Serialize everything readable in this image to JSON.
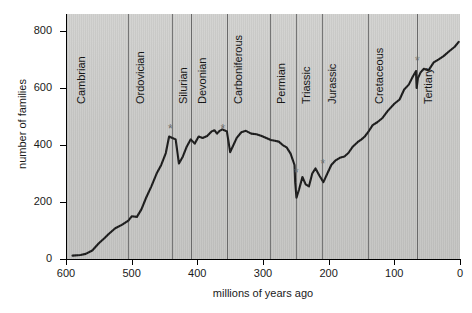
{
  "figure": {
    "background_color": "#c9c9c7",
    "curve_color": "#1a1a1a",
    "divider_color": "#6d6d6d",
    "marker_color": "#6a6a6a"
  },
  "chart_data": {
    "type": "line",
    "title": "",
    "xlabel": "millions of years ago",
    "ylabel": "number of families",
    "xlim": [
      600,
      0
    ],
    "ylim": [
      0,
      860
    ],
    "x_reversed": true,
    "grid": false,
    "legend": "none",
    "xticks": [
      600,
      500,
      400,
      300,
      200,
      100,
      0
    ],
    "yticks": [
      0,
      200,
      400,
      600,
      800
    ],
    "xtick_labels": [
      "600",
      "500",
      "400",
      "300",
      "200",
      "100",
      "0"
    ],
    "ytick_labels": [
      "0",
      "200",
      "400",
      "600",
      "800"
    ],
    "series": [
      {
        "name": "marine animal families",
        "x": [
          590,
          578,
          570,
          560,
          550,
          542,
          535,
          525,
          515,
          505,
          500,
          492,
          485,
          478,
          470,
          462,
          455,
          448,
          443,
          438,
          433,
          428,
          422,
          416,
          410,
          404,
          398,
          392,
          385,
          378,
          374,
          370,
          366,
          362,
          359,
          355,
          350,
          345,
          340,
          333,
          326,
          318,
          310,
          302,
          295,
          288,
          282,
          276,
          270,
          264,
          258,
          252,
          251,
          249,
          245,
          240,
          235,
          230,
          225,
          220,
          214,
          208,
          202,
          199,
          196,
          190,
          183,
          176,
          170,
          163,
          156,
          150,
          145,
          140,
          133,
          126,
          118,
          110,
          100,
          92,
          85,
          78,
          72,
          67,
          66,
          64,
          60,
          55,
          48,
          40,
          33,
          25,
          16,
          8,
          2
        ],
        "y": [
          12,
          14,
          18,
          30,
          55,
          72,
          88,
          108,
          120,
          135,
          150,
          148,
          175,
          215,
          255,
          300,
          330,
          372,
          430,
          425,
          420,
          335,
          360,
          395,
          420,
          405,
          430,
          425,
          432,
          448,
          452,
          440,
          450,
          455,
          452,
          448,
          375,
          400,
          425,
          445,
          450,
          440,
          438,
          432,
          425,
          418,
          415,
          412,
          400,
          392,
          370,
          330,
          268,
          215,
          245,
          288,
          262,
          255,
          300,
          318,
          292,
          270,
          300,
          315,
          330,
          345,
          355,
          360,
          372,
          395,
          410,
          420,
          430,
          445,
          470,
          480,
          495,
          520,
          545,
          560,
          595,
          612,
          640,
          660,
          600,
          635,
          655,
          668,
          662,
          690,
          700,
          712,
          730,
          745,
          762
        ]
      }
    ],
    "extinction_markers": [
      {
        "name": "end-Ordovician",
        "x": 440,
        "y": 452,
        "symbol": "*"
      },
      {
        "name": "late-Devonian",
        "x": 360,
        "y": 452,
        "symbol": "*"
      },
      {
        "name": "end-Permian",
        "x": 248,
        "y": 300,
        "symbol": "*"
      },
      {
        "name": "end-Triassic",
        "x": 208,
        "y": 330,
        "symbol": "*"
      },
      {
        "name": "end-Cretaceous",
        "x": 64,
        "y": 690,
        "symbol": "*"
      }
    ],
    "periods": [
      {
        "label": "Cambrian",
        "boundary_start": 600,
        "boundary_end": 505,
        "label_x": 588
      },
      {
        "label": "Ordovician",
        "boundary_start": 505,
        "boundary_end": 438,
        "label_x": 498
      },
      {
        "label": "Silurian",
        "boundary_start": 438,
        "boundary_end": 410,
        "label_x": 433
      },
      {
        "label": "Devonian",
        "boundary_start": 410,
        "boundary_end": 355,
        "label_x": 404
      },
      {
        "label": "Carboniferous",
        "boundary_start": 355,
        "boundary_end": 290,
        "label_x": 349
      },
      {
        "label": "Permian",
        "boundary_start": 290,
        "boundary_end": 250,
        "label_x": 284
      },
      {
        "label": "Triassic",
        "boundary_start": 250,
        "boundary_end": 210,
        "label_x": 245
      },
      {
        "label": "Jurassic",
        "boundary_start": 210,
        "boundary_end": 140,
        "label_x": 205
      },
      {
        "label": "Cretaceous",
        "boundary_start": 140,
        "boundary_end": 66,
        "label_x": 134
      },
      {
        "label": "Tertiary",
        "boundary_start": 66,
        "boundary_end": 0,
        "label_x": 60
      }
    ]
  }
}
